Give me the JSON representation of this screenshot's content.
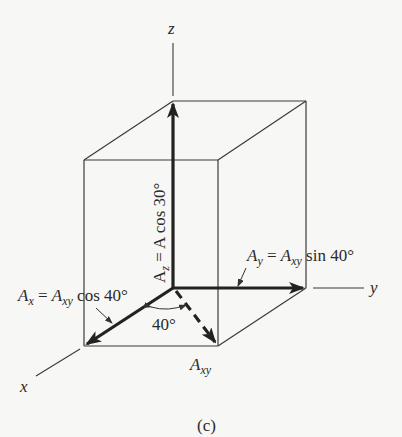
{
  "figure": {
    "caption": "(c)",
    "axes": {
      "x_label": "x",
      "y_label": "y",
      "z_label": "z"
    },
    "vectors": {
      "z_component": {
        "label": "A",
        "subscript": "z",
        "equation_rest": " = A cos 30°"
      },
      "y_component": {
        "label": "A",
        "subscript": "y",
        "eq": " = ",
        "label2": "A",
        "subscript2": "xy",
        "equation_rest": " sin 40°"
      },
      "x_component": {
        "label": "A",
        "subscript": "x",
        "eq": " = ",
        "label2": "A",
        "subscript2": "xy",
        "equation_rest": " cos 40°"
      },
      "xy_projection": {
        "label": "A",
        "subscript": "xy"
      }
    },
    "angle_label": "40°"
  }
}
